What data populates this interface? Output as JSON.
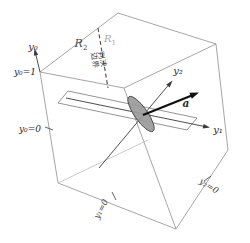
{
  "figure": {
    "title_meaning": "3D augmented feature space with decision boundary on plane y0=1",
    "labels": {
      "y0_axis": "y₀",
      "y0_eq_1": "y₀=1",
      "y0_eq_0": "y₀=0",
      "y1_axis": "y₁",
      "y2_axis": "y₂",
      "y1_eq_0": "y₁=0",
      "y2_eq_0": "y₂=0",
      "weight_vector": "a"
    },
    "regions": {
      "r2": {
        "letter": "R",
        "sub": "2"
      },
      "r1": {
        "letter": "R",
        "sub": "1"
      }
    },
    "boundary": {
      "line1": "判决",
      "line2": "边界"
    },
    "colors": {
      "background": "#ffffff",
      "box_edges": "#8f8f8f",
      "axes": "#3a3a3a",
      "vector_a": "#111111",
      "dashed_boundary": "#555555",
      "region1_text": "#a8a8a8",
      "region2_text": "#474747",
      "ellipse_fill": "#9a9a9a",
      "ellipse_stroke": "#4a4a4a"
    }
  }
}
